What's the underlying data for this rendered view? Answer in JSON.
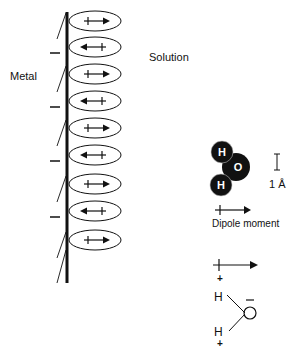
{
  "labels": {
    "metal": "Metal",
    "solution": "Solution",
    "dipole_moment": "Dipole moment",
    "scale": "1 Å"
  },
  "molecule": {
    "atom_top": "H",
    "atom_center": "O",
    "atom_bottom": "H"
  },
  "schematic": {
    "h_top": "H",
    "h_bottom": "H",
    "plus_top": "+",
    "plus_bottom": "+",
    "minus": "–"
  },
  "dipoles": [
    {
      "direction": "right",
      "cy": 21
    },
    {
      "direction": "left",
      "cy": 47
    },
    {
      "direction": "right",
      "cy": 74
    },
    {
      "direction": "left",
      "cy": 101
    },
    {
      "direction": "right",
      "cy": 128
    },
    {
      "direction": "left",
      "cy": 155
    },
    {
      "direction": "right",
      "cy": 184
    },
    {
      "direction": "left",
      "cy": 211
    },
    {
      "direction": "right",
      "cy": 240
    }
  ],
  "colors": {
    "ink": "#111111",
    "background": "#ffffff"
  }
}
